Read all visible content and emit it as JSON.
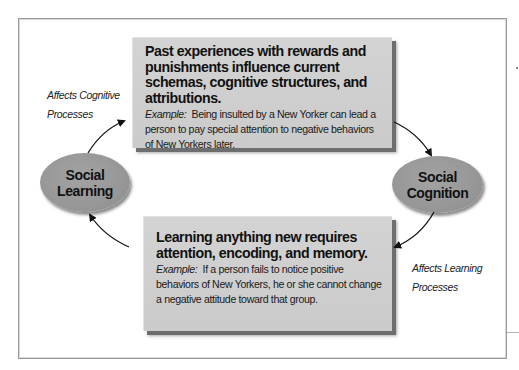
{
  "diagram": {
    "nodes": {
      "social_learning": {
        "line1": "Social",
        "line2": "Learning"
      },
      "social_cognition": {
        "line1": "Social",
        "line2": "Cognition"
      }
    },
    "top_box": {
      "headline": "Past experiences with rewards and punishments influence current schemas, cognitive structures, and attributions.",
      "example_label": "Example:",
      "example_text": "Being insulted by a New Yorker can lead a person to pay special attention to negative behaviors of New Yorkers later."
    },
    "bottom_box": {
      "headline": "Learning anything new requires attention, encoding, and memory.",
      "example_label": "Example:",
      "example_text": "If a person fails to notice positive behaviors of New Yorkers,  he or she cannot change a negative attitude toward that group."
    },
    "captions": {
      "left": {
        "line1": "Affects Cognitive",
        "line2": "Processes"
      },
      "right": {
        "line1": "Affects Learning",
        "line2": "Processes"
      }
    },
    "colors": {
      "box_fill": "#d0d0d0",
      "ellipse_fill": "#999999",
      "arrow": "#111111",
      "frame": "#9a9a9a"
    }
  }
}
